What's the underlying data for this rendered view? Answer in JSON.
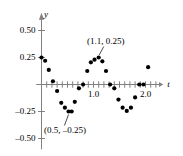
{
  "chart_data": {
    "type": "scatter",
    "title": "",
    "xlabel": "t",
    "ylabel": "y",
    "xlim": [
      -0.12,
      2.35
    ],
    "ylim": [
      -0.62,
      0.66
    ],
    "grid": false,
    "legend": null,
    "marker": {
      "shape": "circle",
      "color": "#000000",
      "size_px": 4.2
    },
    "axis_color": "#808080",
    "x_ticks": [
      0.1,
      0.2,
      0.3,
      0.4,
      0.5,
      0.6,
      0.7,
      0.8,
      0.9,
      1.0,
      1.1,
      1.2,
      1.3,
      1.4,
      1.5,
      1.6,
      1.7,
      1.8,
      1.9,
      2.0,
      2.1,
      2.2
    ],
    "x_tick_labels": [
      {
        "value": 1.0,
        "text": "1.0"
      },
      {
        "value": 2.0,
        "text": "2.0"
      }
    ],
    "y_ticks": [
      -0.5,
      -0.25,
      0.25,
      0.5
    ],
    "y_tick_labels": [
      {
        "value": 0.5,
        "text": "0.50"
      },
      {
        "value": 0.25,
        "text": "0.25"
      },
      {
        "value": -0.25,
        "text": "–0.25"
      },
      {
        "value": -0.5,
        "text": "–0.50"
      }
    ],
    "x": [
      0.0,
      0.07,
      0.14,
      0.22,
      0.3,
      0.38,
      0.45,
      0.52,
      0.58,
      0.64,
      0.72,
      0.8,
      0.88,
      0.95,
      1.02,
      1.1,
      1.17,
      1.24,
      1.32,
      1.4,
      1.48,
      1.56,
      1.64,
      1.72,
      1.8,
      1.88,
      1.96,
      2.05
    ],
    "y": [
      0.25,
      0.22,
      0.135,
      0.03,
      -0.06,
      -0.17,
      -0.215,
      -0.25,
      -0.25,
      -0.16,
      -0.035,
      0.0,
      0.125,
      0.205,
      0.23,
      0.25,
      0.215,
      0.125,
      0.0,
      -0.035,
      -0.14,
      -0.215,
      -0.245,
      -0.215,
      -0.12,
      0.0,
      0.0,
      0.16
    ],
    "points": [
      {
        "t": 0.0,
        "y": 0.25
      },
      {
        "t": 0.07,
        "y": 0.22
      },
      {
        "t": 0.14,
        "y": 0.135
      },
      {
        "t": 0.22,
        "y": 0.03
      },
      {
        "t": 0.3,
        "y": -0.06
      },
      {
        "t": 0.38,
        "y": -0.17
      },
      {
        "t": 0.45,
        "y": -0.215
      },
      {
        "t": 0.52,
        "y": -0.25
      },
      {
        "t": 0.58,
        "y": -0.25
      },
      {
        "t": 0.64,
        "y": -0.16
      },
      {
        "t": 0.72,
        "y": -0.035
      },
      {
        "t": 0.8,
        "y": 0.0
      },
      {
        "t": 0.88,
        "y": 0.125
      },
      {
        "t": 0.95,
        "y": 0.205
      },
      {
        "t": 1.02,
        "y": 0.23
      },
      {
        "t": 1.1,
        "y": 0.25
      },
      {
        "t": 1.17,
        "y": 0.215
      },
      {
        "t": 1.24,
        "y": 0.125
      },
      {
        "t": 1.32,
        "y": 0.0
      },
      {
        "t": 1.4,
        "y": -0.035
      },
      {
        "t": 1.48,
        "y": -0.14
      },
      {
        "t": 1.56,
        "y": -0.215
      },
      {
        "t": 1.64,
        "y": -0.245
      },
      {
        "t": 1.72,
        "y": -0.215
      },
      {
        "t": 1.8,
        "y": -0.12
      },
      {
        "t": 1.88,
        "y": 0.0
      },
      {
        "t": 1.96,
        "y": 0.0
      },
      {
        "t": 2.05,
        "y": 0.16
      }
    ],
    "annotations": [
      {
        "text": "(1.1, 0.25)",
        "target_t": 1.1,
        "target_y": 0.25,
        "position": "above"
      },
      {
        "text": "(0.5, –0.25)",
        "target_t": 0.52,
        "target_y": -0.25,
        "position": "below"
      }
    ]
  }
}
